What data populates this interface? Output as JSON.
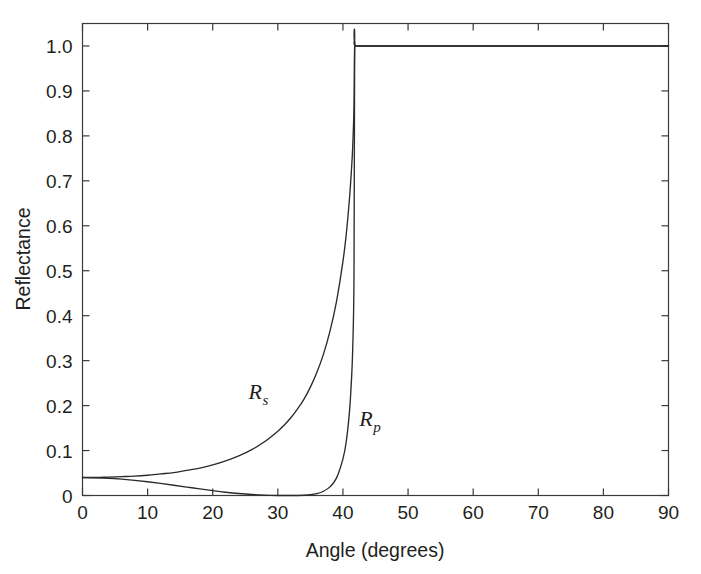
{
  "chart_data": {
    "type": "line",
    "title": "",
    "xlabel": "Angle (degrees)",
    "ylabel": "Reflectance",
    "xlim": [
      0,
      90
    ],
    "ylim": [
      0,
      1.05
    ],
    "grid": false,
    "legend_position": "inline-annotation",
    "xticks": [
      0,
      10,
      20,
      30,
      40,
      50,
      60,
      70,
      80,
      90
    ],
    "xticklabels": [
      "0",
      "10",
      "20",
      "30",
      "40",
      "50",
      "60",
      "70",
      "80",
      "90"
    ],
    "yticks": [
      0,
      0.1,
      0.2,
      0.3,
      0.4,
      0.5,
      0.6,
      0.7,
      0.8,
      0.9,
      1.0
    ],
    "yticklabels": [
      "0",
      "0.1",
      "0.2",
      "0.3",
      "0.4",
      "0.5",
      "0.6",
      "0.7",
      "0.8",
      "0.9",
      "1.0"
    ],
    "annotations": [
      {
        "name": "Rs",
        "text_main": "R",
        "text_sub": "s",
        "x": 25.5,
        "y": 0.215
      },
      {
        "name": "Rp",
        "text_main": "R",
        "text_sub": "p",
        "x": 42.5,
        "y": 0.155
      }
    ],
    "critical_angle": 41.8,
    "brewster_angle": 33.7,
    "x": [
      0,
      2,
      4,
      6,
      8,
      10,
      12,
      14,
      16,
      18,
      20,
      22,
      24,
      26,
      28,
      30,
      31,
      32,
      33,
      34,
      35,
      36,
      37,
      38,
      39,
      40,
      40.5,
      41,
      41.3,
      41.5,
      41.7,
      41.8,
      42,
      45,
      50,
      55,
      60,
      65,
      70,
      75,
      80,
      85,
      90
    ],
    "series": [
      {
        "name": "R_s",
        "label": "Rs",
        "values": [
          0.04,
          0.04,
          0.041,
          0.042,
          0.043,
          0.045,
          0.048,
          0.051,
          0.056,
          0.061,
          0.068,
          0.077,
          0.088,
          0.102,
          0.12,
          0.143,
          0.157,
          0.173,
          0.192,
          0.214,
          0.241,
          0.274,
          0.314,
          0.365,
          0.431,
          0.521,
          0.58,
          0.66,
          0.723,
          0.776,
          0.867,
          1.0,
          1.0,
          1.0,
          1.0,
          1.0,
          1.0,
          1.0,
          1.0,
          1.0,
          1.0,
          1.0,
          1.0
        ]
      },
      {
        "name": "R_p",
        "label": "Rp",
        "values": [
          0.04,
          0.0395,
          0.0383,
          0.0363,
          0.0337,
          0.0305,
          0.0269,
          0.0229,
          0.0188,
          0.0147,
          0.0108,
          0.0073,
          0.0044,
          0.0022,
          0.0008,
          0.0001,
          3e-05,
          0.0,
          7e-05,
          0.0005,
          0.0017,
          0.0043,
          0.0094,
          0.0192,
          0.0386,
          0.0816,
          0.119,
          0.186,
          0.255,
          0.327,
          0.495,
          1.0,
          1.0,
          1.0,
          1.0,
          1.0,
          1.0,
          1.0,
          1.0,
          1.0,
          1.0,
          1.0,
          1.0
        ]
      }
    ]
  },
  "axes": {
    "x_title": "Angle (degrees)",
    "y_title": "Reflectance"
  },
  "colors": {
    "curve": "#2b2b2b",
    "axis": "#3a3a3a",
    "text": "#231f20",
    "background": "#ffffff"
  }
}
